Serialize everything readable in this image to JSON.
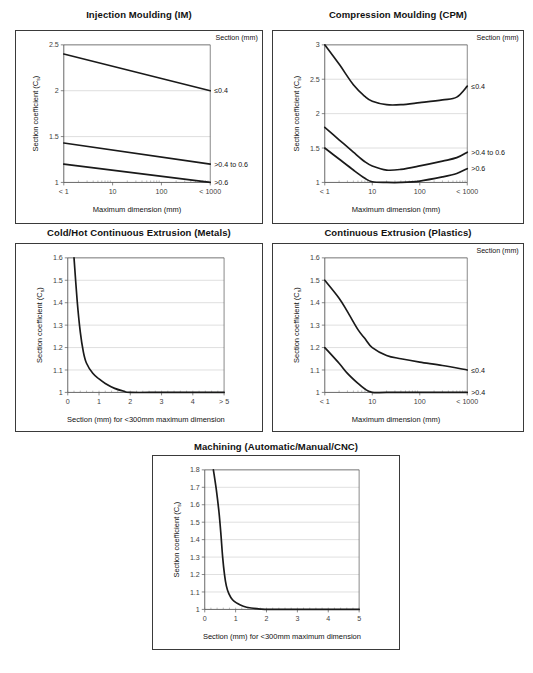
{
  "page": {
    "axis_titles": {
      "y_main": "Section coefficient (C",
      "y_sub": "s",
      "y_close": ")",
      "x_max_dim": "Maximum dimension (mm)",
      "x_section": "Section (mm) for <300mm maximum dimension"
    },
    "section_header": "Section (mm)"
  },
  "chart_data": [
    {
      "id": "injection-moulding",
      "type": "line",
      "title": "Injection Moulding (IM)",
      "xlabel": "Maximum dimension (mm)",
      "ylabel": "Section coefficient (C s)",
      "legend_title": "Section (mm)",
      "legend_position": "right-outside",
      "grid": true,
      "xscale": "log",
      "xticks": [
        "< 1",
        "10",
        "100",
        "< 1000"
      ],
      "xtickvals": [
        1,
        10,
        100,
        1000
      ],
      "ylim": [
        1,
        2.5
      ],
      "yticks": [
        1,
        1.5,
        2,
        2.5
      ],
      "yticklabels": [
        "1",
        "1.5",
        "2",
        "2.5"
      ],
      "series": [
        {
          "name": "≤0.4",
          "x": [
            1,
            1000
          ],
          "values": [
            2.4,
            2.0
          ]
        },
        {
          "name": ">0.4 to 0.6",
          "x": [
            1,
            1000
          ],
          "values": [
            1.43,
            1.2
          ]
        },
        {
          "name": ">0.6",
          "x": [
            1,
            1000
          ],
          "values": [
            1.2,
            1.0
          ]
        }
      ]
    },
    {
      "id": "compression-moulding",
      "type": "line",
      "title": "Compression Moulding (CPM)",
      "xlabel": "Maximum dimension (mm)",
      "ylabel": "Section coefficient (C s)",
      "legend_title": "Section (mm)",
      "legend_position": "right-outside",
      "grid": true,
      "xscale": "log",
      "xticks": [
        "< 1",
        "10",
        "100",
        "< 1000"
      ],
      "xtickvals": [
        1,
        10,
        100,
        1000
      ],
      "ylim": [
        1,
        3
      ],
      "yticks": [
        1,
        1.5,
        2,
        2.5,
        3
      ],
      "yticklabels": [
        "1",
        "1.5",
        "2",
        "2.5",
        "3"
      ],
      "series": [
        {
          "name": "≤0.4",
          "x": [
            1,
            2,
            4,
            7,
            10,
            20,
            40,
            100,
            300,
            600,
            1000
          ],
          "values": [
            3.0,
            2.72,
            2.42,
            2.25,
            2.18,
            2.13,
            2.13,
            2.16,
            2.2,
            2.24,
            2.4
          ]
        },
        {
          "name": ">0.4 to 0.6",
          "x": [
            1,
            2,
            4,
            7,
            10,
            20,
            40,
            100,
            300,
            600,
            1000
          ],
          "values": [
            1.8,
            1.62,
            1.44,
            1.3,
            1.24,
            1.18,
            1.19,
            1.24,
            1.31,
            1.36,
            1.44
          ]
        },
        {
          "name": ">0.6",
          "x": [
            1,
            2,
            4,
            7,
            10,
            20,
            40,
            100,
            300,
            600,
            1000
          ],
          "values": [
            1.5,
            1.34,
            1.18,
            1.06,
            1.01,
            1.0,
            1.0,
            1.02,
            1.08,
            1.13,
            1.2
          ]
        }
      ]
    },
    {
      "id": "cold-hot-continuous-extrusion-metals",
      "type": "line",
      "title": "Cold/Hot Continuous Extrusion (Metals)",
      "xlabel": "Section (mm) for <300mm maximum dimension",
      "ylabel": "Section coefficient (C s)",
      "grid": true,
      "xscale": "linear",
      "xlim": [
        0,
        5
      ],
      "xticks": [
        "0",
        "1",
        "2",
        "3",
        "4",
        "> 5"
      ],
      "xtickvals": [
        0,
        1,
        2,
        3,
        4,
        5
      ],
      "ylim": [
        1,
        1.6
      ],
      "yticks": [
        1,
        1.1,
        1.2,
        1.3,
        1.4,
        1.5,
        1.6
      ],
      "yticklabels": [
        "1",
        "1.1",
        "1.2",
        "1.3",
        "1.4",
        "1.5",
        "1.6"
      ],
      "series": [
        {
          "name": "section-curve",
          "x": [
            0.2,
            0.3,
            0.4,
            0.5,
            0.6,
            0.8,
            1.0,
            1.2,
            1.5,
            1.8,
            2.0,
            3.0,
            4.0,
            5.0
          ],
          "values": [
            1.6,
            1.41,
            1.27,
            1.18,
            1.13,
            1.085,
            1.06,
            1.04,
            1.018,
            1.005,
            1.0,
            1.0,
            1.0,
            1.0
          ]
        }
      ]
    },
    {
      "id": "continuous-extrusion-plastics",
      "type": "line",
      "title": "Continuous Extrusion (Plastics)",
      "xlabel": "Maximum dimension (mm)",
      "ylabel": "Section coefficient (C s)",
      "legend_title": "Section (mm)",
      "legend_position": "right-outside",
      "grid": true,
      "xscale": "log",
      "xticks": [
        "< 1",
        "10",
        "100",
        "< 1000"
      ],
      "xtickvals": [
        1,
        10,
        100,
        1000
      ],
      "ylim": [
        1,
        1.6
      ],
      "yticks": [
        1,
        1.1,
        1.2,
        1.3,
        1.4,
        1.5,
        1.6
      ],
      "yticklabels": [
        "1",
        "1.1",
        "1.2",
        "1.3",
        "1.4",
        "1.5",
        "1.6"
      ],
      "series": [
        {
          "name": "≤0.4",
          "x": [
            1,
            2,
            3,
            5,
            7,
            10,
            20,
            40,
            100,
            300,
            1000
          ],
          "values": [
            1.5,
            1.42,
            1.36,
            1.28,
            1.24,
            1.2,
            1.165,
            1.15,
            1.135,
            1.12,
            1.1
          ]
        },
        {
          "name": ">0.4",
          "x": [
            1,
            2,
            3,
            5,
            7,
            10,
            20,
            100,
            1000
          ],
          "values": [
            1.2,
            1.13,
            1.085,
            1.04,
            1.015,
            1.0,
            1.0,
            1.0,
            1.0
          ]
        }
      ]
    },
    {
      "id": "machining",
      "type": "line",
      "title": "Machining (Automatic/Manual/CNC)",
      "xlabel": "Section (mm) for <300mm maximum dimension",
      "ylabel": "Section coefficient (C s)",
      "grid": true,
      "xscale": "linear",
      "xlim": [
        0,
        5
      ],
      "xticks": [
        "0",
        "1",
        "2",
        "3",
        "4",
        "5"
      ],
      "xtickvals": [
        0,
        1,
        2,
        3,
        4,
        5
      ],
      "ylim": [
        1,
        1.8
      ],
      "yticks": [
        1,
        1.1,
        1.2,
        1.3,
        1.4,
        1.5,
        1.6,
        1.7,
        1.8
      ],
      "yticklabels": [
        "1",
        "1.1",
        "1.2",
        "1.3",
        "1.4",
        "1.5",
        "1.6",
        "1.7",
        "1.8"
      ],
      "series": [
        {
          "name": "section-curve",
          "x": [
            0.28,
            0.38,
            0.46,
            0.52,
            0.58,
            0.64,
            0.7,
            0.78,
            0.9,
            1.05,
            1.25,
            1.5,
            1.8,
            2.1,
            3.0,
            4.0,
            5.0
          ],
          "values": [
            1.8,
            1.68,
            1.56,
            1.44,
            1.3,
            1.2,
            1.135,
            1.09,
            1.055,
            1.035,
            1.018,
            1.008,
            1.002,
            1.0,
            1.0,
            1.0,
            1.0
          ]
        }
      ]
    }
  ],
  "colors": {
    "curve": "#1a1a1a",
    "grid": "#c9c9c9",
    "axis": "#555555",
    "border": "#3a3a3a",
    "tick_text": "#3f3f3f"
  }
}
